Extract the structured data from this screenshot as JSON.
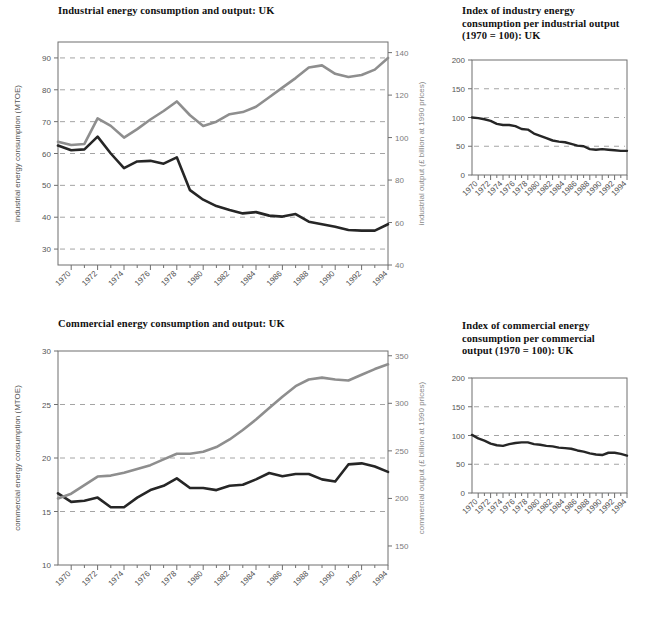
{
  "figure": {
    "background": "#ffffff",
    "dark_series_color": "#262626",
    "light_series_color": "#8e8e8e",
    "grid_color": "#9a9a9a",
    "axis_color": "#6f6f6f"
  },
  "charts": [
    {
      "id": "industrial-energy",
      "title": "Industrial energy consumption and output: UK",
      "chart_data": {
        "type": "line",
        "title": "Industrial energy consumption and output: UK",
        "xlabel": "",
        "ylabel": "industrial energy consumption (MTOE)",
        "y2label": "industrial output (£ billion at 1990 prices)",
        "grid": true,
        "legend": "none",
        "xlim": [
          1969,
          1994
        ],
        "ylim": [
          25,
          95
        ],
        "y2lim": [
          40,
          145
        ],
        "yticks": [
          30,
          40,
          50,
          60,
          70,
          80,
          90
        ],
        "y2ticks": [
          40,
          60,
          80,
          100,
          120,
          140
        ],
        "xticks": [
          1970,
          1972,
          1974,
          1976,
          1978,
          1980,
          1982,
          1984,
          1986,
          1988,
          1990,
          1992,
          1994
        ],
        "x": [
          1969,
          1970,
          1971,
          1972,
          1973,
          1974,
          1975,
          1976,
          1977,
          1978,
          1979,
          1980,
          1981,
          1982,
          1983,
          1984,
          1985,
          1986,
          1987,
          1988,
          1989,
          1990,
          1991,
          1992,
          1993,
          1994
        ],
        "series": [
          {
            "name": "industrial energy consumption (MTOE)",
            "axis": "left",
            "color": "#262626",
            "values": [
              62.5,
              61.0,
              61.3,
              65.3,
              60.0,
              55.4,
              57.5,
              57.7,
              56.8,
              58.8,
              48.5,
              45.5,
              43.5,
              42.3,
              41.2,
              41.6,
              40.5,
              40.2,
              41.0,
              38.6,
              37.8,
              37.0,
              36.0,
              35.8,
              35.8,
              37.8
            ]
          },
          {
            "name": "industrial output (£ billion at 1990 prices)",
            "axis": "right",
            "color": "#8e8e8e",
            "values": [
              98.0,
              96.5,
              97.0,
              109.0,
              105.5,
              100.0,
              104.0,
              108.5,
              112.5,
              117.0,
              110.5,
              105.5,
              107.5,
              111.0,
              112.0,
              114.5,
              119.0,
              123.5,
              128.0,
              133.0,
              134.0,
              130.0,
              128.5,
              129.5,
              132.0,
              137.5
            ]
          }
        ]
      }
    },
    {
      "id": "index-industry",
      "title": "Index of industry energy\nconsumption per industrial output\n(1970 = 100): UK",
      "chart_data": {
        "type": "line",
        "title": "Index of industry energy consumption per industrial output (1970 = 100): UK",
        "xlabel": "",
        "ylabel": "",
        "grid": true,
        "legend": "none",
        "xlim": [
          1969,
          1994
        ],
        "ylim": [
          0,
          200
        ],
        "yticks": [
          0,
          50,
          100,
          150,
          200
        ],
        "xticks": [
          1970,
          1972,
          1974,
          1976,
          1978,
          1980,
          1982,
          1984,
          1986,
          1988,
          1990,
          1992,
          1994
        ],
        "x": [
          1969,
          1970,
          1971,
          1972,
          1973,
          1974,
          1975,
          1976,
          1977,
          1978,
          1979,
          1980,
          1981,
          1982,
          1983,
          1984,
          1985,
          1986,
          1987,
          1988,
          1989,
          1990,
          1991,
          1992,
          1993,
          1994
        ],
        "series": [
          {
            "name": "index of industry energy consumption per industrial output (1970 = 100)",
            "axis": "left",
            "color": "#262626",
            "values": [
              100,
              99,
              97,
              94,
              89,
              87,
              87,
              85,
              80,
              79,
              72,
              68,
              64,
              60,
              58,
              57,
              54,
              51,
              50,
              45,
              44,
              45,
              44,
              43,
              42,
              42
            ]
          }
        ]
      }
    },
    {
      "id": "commercial-energy",
      "title": "Commercial energy consumption and output: UK",
      "chart_data": {
        "type": "line",
        "title": "Commercial energy consumption and output: UK",
        "xlabel": "",
        "ylabel": "commercial energy consumption (MTOE)",
        "y2label": "commercial output (£ billion at 1990 prices)",
        "grid": true,
        "legend": "none",
        "xlim": [
          1969,
          1994
        ],
        "ylim": [
          10,
          30
        ],
        "y2lim": [
          130,
          355
        ],
        "yticks": [
          10,
          15,
          20,
          25,
          30
        ],
        "y2ticks": [
          150,
          200,
          250,
          300,
          350
        ],
        "xticks": [
          1970,
          1972,
          1974,
          1976,
          1978,
          1980,
          1982,
          1984,
          1986,
          1988,
          1990,
          1992,
          1994
        ],
        "x": [
          1969,
          1970,
          1971,
          1972,
          1973,
          1974,
          1975,
          1976,
          1977,
          1978,
          1979,
          1980,
          1981,
          1982,
          1983,
          1984,
          1985,
          1986,
          1987,
          1988,
          1989,
          1990,
          1991,
          1992,
          1993,
          1994
        ],
        "series": [
          {
            "name": "commercial energy consumption (MTOE)",
            "axis": "left",
            "color": "#262626",
            "values": [
              16.7,
              15.9,
              16.0,
              16.3,
              15.4,
              15.4,
              16.3,
              17.0,
              17.4,
              18.1,
              17.2,
              17.2,
              17.0,
              17.4,
              17.5,
              18.0,
              18.6,
              18.3,
              18.5,
              18.5,
              18.0,
              17.8,
              19.4,
              19.5,
              19.2,
              18.7
            ]
          },
          {
            "name": "commercial output (£ billion at 1990 prices)",
            "axis": "right",
            "color": "#8e8e8e",
            "values": [
              200,
              205,
              214,
              223,
              224,
              227,
              231,
              235,
              241,
              247,
              247,
              249,
              254,
              262,
              272,
              283,
              295,
              307,
              318,
              325,
              327,
              325,
              324,
              330,
              336,
              341
            ]
          }
        ]
      }
    },
    {
      "id": "index-commercial",
      "title": "Index of commercial energy\nconsumption per commercial\noutput (1970 = 100): UK",
      "chart_data": {
        "type": "line",
        "title": "Index of commercial energy consumption per commercial output (1970 = 100): UK",
        "xlabel": "",
        "ylabel": "",
        "grid": true,
        "legend": "none",
        "xlim": [
          1969,
          1994
        ],
        "ylim": [
          0,
          200
        ],
        "yticks": [
          0,
          50,
          100,
          150,
          200
        ],
        "xticks": [
          1970,
          1972,
          1974,
          1976,
          1978,
          1980,
          1982,
          1984,
          1986,
          1988,
          1990,
          1992,
          1994
        ],
        "x": [
          1969,
          1970,
          1971,
          1972,
          1973,
          1974,
          1975,
          1976,
          1977,
          1978,
          1979,
          1980,
          1981,
          1982,
          1983,
          1984,
          1985,
          1986,
          1987,
          1988,
          1989,
          1990,
          1991,
          1992,
          1993,
          1994
        ],
        "series": [
          {
            "name": "index of commercial energy consumption per commercial output (1970 = 100)",
            "axis": "left",
            "color": "#262626",
            "values": [
              101,
              95,
              91,
              86,
              83,
              82,
              85,
              87,
              88,
              88,
              85,
              84,
              82,
              81,
              79,
              78,
              77,
              74,
              72,
              69,
              67,
              66,
              70,
              70,
              68,
              65
            ]
          }
        ]
      }
    }
  ]
}
